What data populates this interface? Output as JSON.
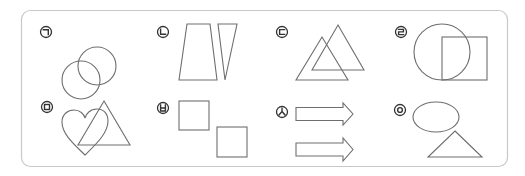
{
  "figure": {
    "items": [
      {
        "label": "ㄱ",
        "content": "two overlapping circles"
      },
      {
        "label": "ㄴ",
        "content": "trapezoid and inverted narrow triangle"
      },
      {
        "label": "ㄷ",
        "content": "two overlapping triangles"
      },
      {
        "label": "ㄹ",
        "content": "circle overlapping square"
      },
      {
        "label": "ㅁ",
        "content": "heart overlapping triangle"
      },
      {
        "label": "ㅂ",
        "content": "two squares"
      },
      {
        "label": "ㅅ",
        "content": "two right arrows"
      },
      {
        "label": "ㅇ",
        "content": "ellipse and triangle"
      }
    ]
  },
  "colors": {
    "frame": "#c8c8c8",
    "shape_stroke": "#6e6e6e",
    "label": "#333333"
  }
}
